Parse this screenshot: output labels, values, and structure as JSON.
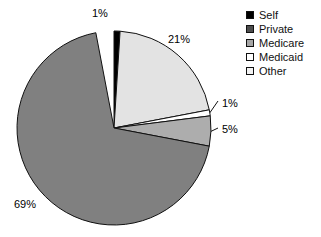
{
  "chart_data": {
    "type": "pie",
    "title": "",
    "subtitle": "",
    "xlabel": "",
    "ylabel": "",
    "grid": false,
    "legend_position": "top-right",
    "start_angle_deg": 0,
    "direction": "clockwise",
    "center": {
      "x": 114,
      "y": 128
    },
    "radius": 97,
    "categories": [
      "Self",
      "Private",
      "Medicare",
      "Medicaid",
      "Other"
    ],
    "values": [
      1,
      69,
      21,
      1,
      5
    ],
    "labels": [
      "1%",
      "69%",
      "21%",
      "1%",
      "5%"
    ],
    "colors": [
      "#000000",
      "#808080",
      "#e3e3e3",
      "#ffffff",
      "#adadad"
    ],
    "slices": [
      {
        "name": "Self",
        "value": 1,
        "label": "1%",
        "color": "#000000",
        "start_deg": 0,
        "end_deg": 3.6,
        "leader_line": false
      },
      {
        "name": "Medicare",
        "value": 21,
        "label": "21%",
        "color": "#e3e3e3",
        "start_deg": 3.6,
        "end_deg": 79.2,
        "leader_line": false
      },
      {
        "name": "Medicaid",
        "value": 1,
        "label": "1%",
        "color": "#ffffff",
        "start_deg": 79.2,
        "end_deg": 82.8,
        "leader_line": true
      },
      {
        "name": "Other",
        "value": 5,
        "label": "5%",
        "color": "#adadad",
        "start_deg": 82.8,
        "end_deg": 100.8,
        "leader_line": true
      },
      {
        "name": "Private",
        "value": 69,
        "label": "69%",
        "color": "#808080",
        "start_deg": 100.8,
        "end_deg": 349.2,
        "leader_line": false
      }
    ],
    "legend": {
      "entries": [
        {
          "label": "Self",
          "color": "#000000"
        },
        {
          "label": "Private",
          "color": "#4d4d4d"
        },
        {
          "label": "Medicare",
          "color": "#a6a6a6"
        },
        {
          "label": "Medicaid",
          "color": "#ffffff"
        },
        {
          "label": "Other",
          "color": "#f2f2f2"
        }
      ]
    }
  },
  "style": {
    "background": "#ffffff",
    "outline": "#111111",
    "text": "#111111"
  }
}
